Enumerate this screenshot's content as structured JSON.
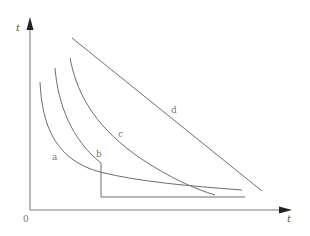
{
  "diagram": {
    "y_axis_label": "t",
    "x_axis_label": "t",
    "origin_label": "0",
    "curves": [
      {
        "id": "a",
        "label": "a",
        "kind": "convex-decreasing curve"
      },
      {
        "id": "b",
        "label": "b",
        "kind": "convex-decreasing curve with vertical drop then horizontal"
      },
      {
        "id": "c",
        "label": "c",
        "kind": "convex-decreasing curve"
      },
      {
        "id": "d",
        "label": "d",
        "kind": "straight decreasing line"
      }
    ],
    "colors": {
      "lines": "#6e6e6e",
      "axes": "#7a7a7a",
      "arrows": "#222222",
      "labels": "#777777"
    }
  }
}
